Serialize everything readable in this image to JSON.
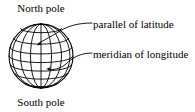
{
  "figure": {
    "kind": "globe-graticule-diagram",
    "background_color": "#ffffff",
    "stroke_color": "#000000",
    "width": 195,
    "height": 112
  },
  "labels": {
    "north_pole": "North pole",
    "south_pole": "South pole",
    "parallel": "parallel of latitude",
    "meridian": "meridian of longitude"
  },
  "globe": {
    "center_x": 41,
    "center_y": 56,
    "radius": 32,
    "latitude_lines": 7,
    "meridian_lines": 7
  },
  "leaders": {
    "parallel_target_x": 37,
    "parallel_target_y": 44,
    "meridian_target_x": 47,
    "meridian_target_y": 69
  }
}
